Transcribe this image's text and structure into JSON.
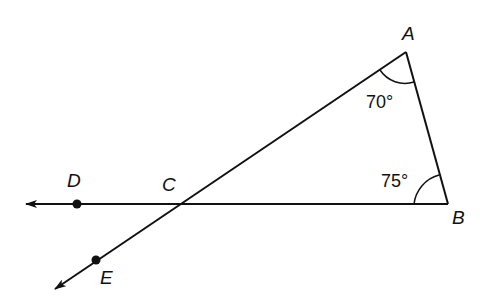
{
  "diagram": {
    "type": "geometry",
    "points": {
      "A": {
        "label": "A",
        "x": 406,
        "y": 52
      },
      "B": {
        "label": "B",
        "x": 448,
        "y": 204
      },
      "C": {
        "label": "C",
        "x": 178,
        "y": 204
      },
      "D": {
        "label": "D",
        "x": 77,
        "y": 204
      },
      "E": {
        "label": "E",
        "x": 96,
        "y": 260
      }
    },
    "angles": {
      "A": {
        "label": "70°",
        "value": 70
      },
      "B": {
        "label": "75°",
        "value": 75
      }
    },
    "colors": {
      "line": "#111111",
      "background": "#ffffff"
    }
  }
}
